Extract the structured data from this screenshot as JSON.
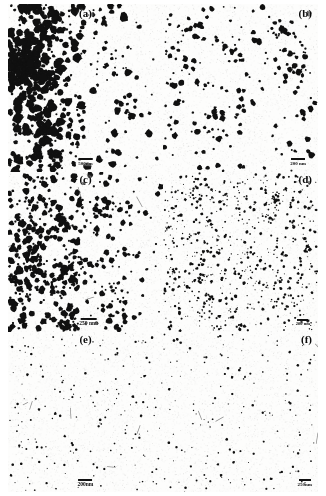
{
  "figure": {
    "type": "electron-micrograph-grid",
    "rows": 3,
    "columns": 2,
    "background_color": "#ffffff",
    "particle_color": "#101010",
    "width_px": 326,
    "height_px": 496
  },
  "panels": [
    {
      "id": "a",
      "label": "(a)",
      "label_position": "top-center",
      "scalebar": {
        "text": "500nm",
        "value": 500,
        "unit": "nm",
        "position": "bottom-center",
        "bar_width_px": 14,
        "font_size_px": 5
      },
      "appearance": {
        "particle_count": 620,
        "min_radius_px": 1.0,
        "max_radius_px": 4.6,
        "clustering": 0.62,
        "coverage": "high",
        "description": "dense large agglomerated particles"
      }
    },
    {
      "id": "b",
      "label": "(b)",
      "label_position": "top-right",
      "scalebar": {
        "text": "200 nm",
        "value": 200,
        "unit": "nm",
        "position": "bottom-right",
        "bar_width_px": 14,
        "font_size_px": 5
      },
      "appearance": {
        "particle_count": 230,
        "min_radius_px": 0.9,
        "max_radius_px": 3.2,
        "clustering": 0.22,
        "coverage": "medium",
        "description": "well separated medium spherical particles"
      }
    },
    {
      "id": "c",
      "label": "(c)",
      "label_position": "top-center",
      "scalebar": {
        "text": "250 nm.",
        "value": 250,
        "unit": "nm",
        "position": "bottom-center",
        "bar_width_px": 16,
        "font_size_px": 5.5
      },
      "appearance": {
        "particle_count": 520,
        "min_radius_px": 1.0,
        "max_radius_px": 3.6,
        "clustering": 0.38,
        "coverage": "high",
        "description": "dense uniform round particles, denser at left"
      }
    },
    {
      "id": "d",
      "label": "(d)",
      "label_position": "top-right",
      "scalebar": {
        "text": "200 nm",
        "value": 200,
        "unit": "nm",
        "position": "bottom-right",
        "bar_width_px": 11,
        "font_size_px": 4.5
      },
      "appearance": {
        "particle_count": 700,
        "min_radius_px": 0.5,
        "max_radius_px": 1.7,
        "clustering": 0.18,
        "coverage": "high",
        "description": "very dense fine nanoparticles"
      }
    },
    {
      "id": "e",
      "label": "(e)",
      "label_position": "top-center",
      "scalebar": {
        "text": "200nm",
        "value": 200,
        "unit": "nm",
        "position": "bottom-center",
        "bar_width_px": 14,
        "font_size_px": 5.5
      },
      "appearance": {
        "particle_count": 175,
        "min_radius_px": 0.5,
        "max_radius_px": 1.4,
        "clustering": 0.08,
        "coverage": "low",
        "description": "sparse fine particles on light background"
      }
    },
    {
      "id": "f",
      "label": "(f)",
      "label_position": "top-right",
      "scalebar": {
        "text": "250nm",
        "value": 250,
        "unit": "nm",
        "position": "bottom-right",
        "bar_width_px": 12,
        "font_size_px": 5
      },
      "appearance": {
        "particle_count": 150,
        "min_radius_px": 0.5,
        "max_radius_px": 1.4,
        "clustering": 0.08,
        "coverage": "low",
        "description": "sparse fine particles on light background"
      }
    }
  ]
}
